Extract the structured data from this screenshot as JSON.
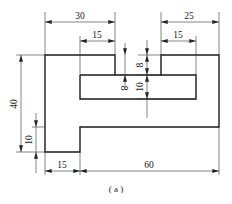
{
  "figure": {
    "caption": "( a )",
    "units": "mm"
  },
  "dimensions": {
    "top_left_width": "30",
    "top_left_notch_width": "15",
    "top_right_width": "25",
    "top_right_notch_width": "15",
    "left_notch_depth": "8",
    "right_notch_depth": "8",
    "slot_height": "10",
    "overall_height": "40",
    "foot_height": "10",
    "foot_width": "15",
    "main_body_width": "60"
  },
  "colors": {
    "outline": "#1a1a1a",
    "dimension_lines": "#333333",
    "background": "#ffffff"
  }
}
